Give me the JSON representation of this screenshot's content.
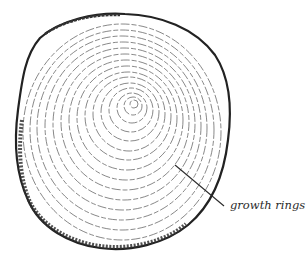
{
  "figure": {
    "callouts": [
      {
        "label": "growth rings",
        "target": "growth-rings"
      }
    ]
  },
  "colors": {
    "ink": "#2b2b2b",
    "ring": "#555555",
    "background": "#ffffff"
  }
}
